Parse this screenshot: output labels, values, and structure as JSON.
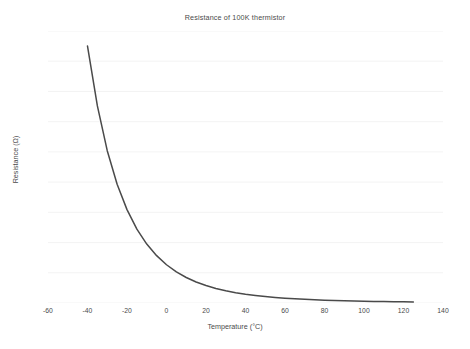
{
  "chart_data": {
    "type": "line",
    "title": "Resistance of 100K thermistor",
    "xlabel": "Temperature (°C)",
    "ylabel": "Resistance (Ω)",
    "xlim": [
      -60,
      140
    ],
    "ylim": [
      0,
      4500
    ],
    "xticks": [
      -60,
      -40,
      -20,
      0,
      20,
      40,
      60,
      80,
      100,
      120,
      140
    ],
    "xtick_labels": [
      "-60",
      "-40",
      "-20",
      "0",
      "20",
      "40",
      "60",
      "80",
      "100",
      "120",
      "140"
    ],
    "yticks": [
      0,
      500,
      1000,
      1500,
      2000,
      2500,
      3000,
      3500,
      4000,
      4500
    ],
    "ytick_labels": [
      "0",
      "500",
      "1000",
      "1500",
      "2000",
      "2500",
      "3000",
      "3500",
      "4000",
      "4500"
    ],
    "grid": true,
    "grid_axis": "y",
    "legend": false,
    "series": [
      {
        "name": "Resistance",
        "color": "#4a4a4a",
        "x": [
          -40,
          -35,
          -30,
          -25,
          -20,
          -15,
          -10,
          -5,
          0,
          5,
          10,
          15,
          20,
          25,
          30,
          35,
          40,
          45,
          50,
          55,
          60,
          65,
          70,
          75,
          80,
          85,
          90,
          95,
          100,
          105,
          110,
          115,
          120,
          125
        ],
        "y": [
          4250,
          3260,
          2520,
          1965,
          1545,
          1222,
          975,
          783,
          633,
          515,
          422,
          348,
          289,
          241,
          202,
          171,
          145,
          124,
          106,
          91,
          79,
          69,
          60,
          53,
          46,
          41,
          36,
          32,
          29,
          26,
          23,
          21,
          19,
          17
        ]
      }
    ]
  },
  "figure": {
    "background_color": "#ffffff",
    "text_color": "#4a4a4a",
    "grid_color": "#f0f0f0"
  }
}
